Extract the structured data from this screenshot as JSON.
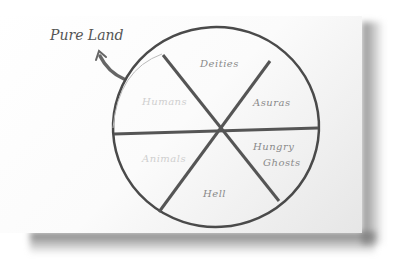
{
  "diagram": {
    "annotation": "Pure Land",
    "annotation_arrow": "curved-arrow-pointing-up-left",
    "wheel": {
      "shape": "circle divided into six segments",
      "segments": [
        {
          "label": "Deities",
          "position": "top"
        },
        {
          "label": "Asuras",
          "position": "upper-right"
        },
        {
          "label": "Hungry Ghosts",
          "line1": "Hungry",
          "line2": "Ghosts",
          "position": "lower-right"
        },
        {
          "label": "Hell",
          "position": "bottom"
        },
        {
          "label": "Animals",
          "position": "lower-left"
        },
        {
          "label": "Humans",
          "position": "upper-left"
        }
      ]
    },
    "colors": {
      "paper": "#ffffff",
      "ink": "#555555",
      "label_ink": "#8a8a8a",
      "shadow": "#7a7a7a"
    }
  }
}
